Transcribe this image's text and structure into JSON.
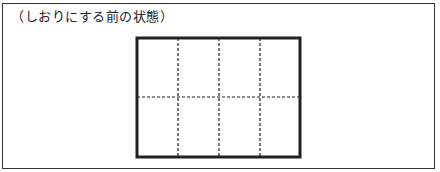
{
  "caption": "（しおりにする前の状態）",
  "diagram": {
    "sheet": {
      "x": 137,
      "y": 38,
      "width": 163,
      "height": 119,
      "stroke": "#222222",
      "stroke_width": 3
    },
    "fold_lines": {
      "vertical_x": [
        178,
        219,
        260
      ],
      "horizontal_y": [
        97
      ],
      "style": "dashed",
      "stroke": "#222222"
    },
    "columns": 4,
    "rows": 2
  }
}
